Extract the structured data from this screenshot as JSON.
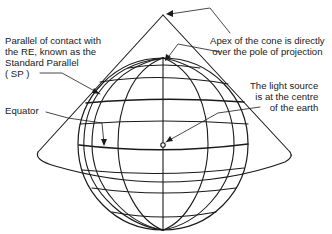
{
  "diagram": {
    "type": "conical-projection",
    "labels": {
      "standard_parallel": "Parallel of contact with\nthe RE, known as the\nStandard Parallel\n( SP )",
      "equator": "Equator",
      "apex": "Apex of the cone is directly\nover the pole of projection",
      "light_source": "The light source\nis at the centre\nof the earth"
    },
    "colors": {
      "line": "#1a1a1a",
      "background": "#ffffff"
    }
  }
}
